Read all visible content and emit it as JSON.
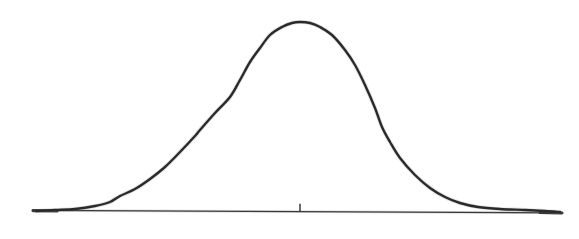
{
  "figure": {
    "width": 579,
    "height": 239,
    "background_color": "#ffffff",
    "ink_color": "#2a2a2a",
    "axis_color": "#4a4a4a",
    "title": "",
    "subtitle": "",
    "caption": ""
  },
  "chart_data": {
    "type": "line",
    "title": "",
    "subtitle": "",
    "xlabel": "",
    "ylabel": "",
    "legend": [],
    "legend_position": "none",
    "grid": false,
    "axis": {
      "x_axis_visible": true,
      "y_axis_visible": false,
      "x_axis_y_pixel": 212,
      "x_axis_start_pixel": 33,
      "x_axis_end_pixel": 562,
      "x_tick_pixels": [
        300
      ],
      "x_tick_labels": [
        ""
      ],
      "tick_height_pixels": 8,
      "xlim": [
        -4.3,
        4.3
      ],
      "ylim": [
        0,
        1.0
      ]
    },
    "distribution": {
      "name": "normal",
      "mean_pixel_x": 300,
      "mean_value": 0,
      "sigma_pixel": 62,
      "sigma_value": 1,
      "peak_pixel_y": 22,
      "peak_height_pixels": 190,
      "peak_value": 1.0
    },
    "x": [
      -4.3,
      -4.0,
      -3.7,
      -3.4,
      -3.1,
      -2.8,
      -2.5,
      -2.2,
      -1.9,
      -1.6,
      -1.3,
      -1.0,
      -0.7,
      -0.4,
      -0.1,
      0.0,
      0.1,
      0.4,
      0.7,
      1.0,
      1.3,
      1.6,
      1.9,
      2.2,
      2.5,
      2.8,
      3.1,
      3.4,
      3.7,
      4.0,
      4.3
    ],
    "values": [
      0.0001,
      0.0003,
      0.0011,
      0.0034,
      0.0085,
      0.0198,
      0.0439,
      0.0889,
      0.1645,
      0.278,
      0.4296,
      0.6065,
      0.7827,
      0.9231,
      0.995,
      1.0,
      0.995,
      0.9231,
      0.7827,
      0.6065,
      0.4296,
      0.278,
      0.1645,
      0.0889,
      0.0439,
      0.0198,
      0.0085,
      0.0034,
      0.0011,
      0.0003,
      0.0001
    ],
    "series": [
      {
        "name": "normal-curve",
        "color": "#2a2a2a",
        "line_width": 2.4,
        "values": [
          0.0001,
          0.0003,
          0.0011,
          0.0034,
          0.0085,
          0.0198,
          0.0439,
          0.0889,
          0.1645,
          0.278,
          0.4296,
          0.6065,
          0.7827,
          0.9231,
          0.995,
          1.0,
          0.995,
          0.9231,
          0.7827,
          0.6065,
          0.4296,
          0.278,
          0.1645,
          0.0889,
          0.0439,
          0.0198,
          0.0085,
          0.0034,
          0.0011,
          0.0003,
          0.0001
        ]
      }
    ],
    "pixel_path_points": [
      [
        36,
        211
      ],
      [
        55,
        210
      ],
      [
        75,
        209
      ],
      [
        95,
        206
      ],
      [
        110,
        202
      ],
      [
        120,
        196
      ],
      [
        135,
        189
      ],
      [
        150,
        179
      ],
      [
        165,
        167
      ],
      [
        180,
        152
      ],
      [
        195,
        136
      ],
      [
        200,
        130
      ],
      [
        215,
        113
      ],
      [
        230,
        97
      ],
      [
        240,
        80
      ],
      [
        250,
        62
      ],
      [
        260,
        48
      ],
      [
        270,
        35
      ],
      [
        282,
        27
      ],
      [
        292,
        23
      ],
      [
        300,
        22
      ],
      [
        310,
        23
      ],
      [
        320,
        27
      ],
      [
        332,
        35
      ],
      [
        345,
        50
      ],
      [
        355,
        65
      ],
      [
        365,
        85
      ],
      [
        375,
        108
      ],
      [
        382,
        127
      ],
      [
        390,
        142
      ],
      [
        400,
        158
      ],
      [
        415,
        175
      ],
      [
        430,
        188
      ],
      [
        445,
        197
      ],
      [
        460,
        203
      ],
      [
        478,
        207
      ],
      [
        500,
        209
      ],
      [
        525,
        210
      ],
      [
        545,
        211
      ],
      [
        560,
        212
      ]
    ],
    "annotations": [
      {
        "type": "tick",
        "label": "",
        "x_pixel": 300,
        "y_pixel": 212,
        "height_pixels": 8,
        "description": "centre tick mark at the mean"
      }
    ]
  }
}
